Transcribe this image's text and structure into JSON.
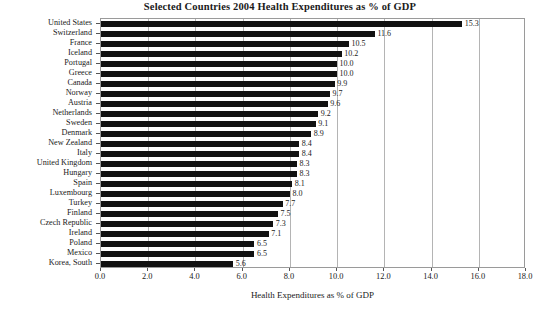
{
  "chart_data": {
    "type": "bar",
    "orientation": "horizontal",
    "title": "Selected Countries 2004 Health Expenditures as % of GDP",
    "xlabel": "Health Expenditures as % of GDP",
    "ylabel": "",
    "xlim": [
      0.0,
      18.0
    ],
    "xticks": [
      "0.0",
      "2.0",
      "4.0",
      "6.0",
      "8.0",
      "10.0",
      "12.0",
      "14.0",
      "16.0",
      "18.0"
    ],
    "xtick_values": [
      0,
      2,
      4,
      6,
      8,
      10,
      12,
      14,
      16,
      18
    ],
    "grid": "vertical",
    "legend": "none",
    "bar_color": "#111111",
    "grid_color": "#b4b4b4",
    "frame_color": "#9a9a9a",
    "categories": [
      "United States",
      "Switzerland",
      "France",
      "Iceland",
      "Portugal",
      "Greece",
      "Canada",
      "Norway",
      "Austria",
      "Netherlands",
      "Sweden",
      "Denmark",
      "New Zealand",
      "Italy",
      "United Kingdom",
      "Hungary",
      "Spain",
      "Luxembourg",
      "Turkey",
      "Finland",
      "Czech Republic",
      "Ireland",
      "Poland",
      "Mexico",
      "Korea, South"
    ],
    "values": [
      15.3,
      11.6,
      10.5,
      10.2,
      10.0,
      10.0,
      9.9,
      9.7,
      9.6,
      9.2,
      9.1,
      8.9,
      8.4,
      8.4,
      8.3,
      8.3,
      8.1,
      8.0,
      7.7,
      7.5,
      7.3,
      7.1,
      6.5,
      6.5,
      5.6
    ],
    "value_labels": [
      "15.3",
      "11.6",
      "10.5",
      "10.2",
      "10.0",
      "10.0",
      "9.9",
      "9.7",
      "9.6",
      "9.2",
      "9.1",
      "8.9",
      "8.4",
      "8.4",
      "8.3",
      "8.3",
      "8.1",
      "8.0",
      "7.7",
      "7.5",
      "7.3",
      "7.1",
      "6.5",
      "6.5",
      "5.6"
    ]
  }
}
